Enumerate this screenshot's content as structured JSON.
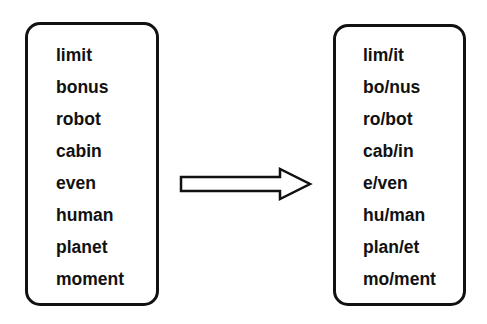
{
  "left_box": {
    "words": [
      "limit",
      "bonus",
      "robot",
      "cabin",
      "even",
      "human",
      "planet",
      "moment"
    ]
  },
  "arrow": {
    "icon": "right-arrow-icon",
    "direction": "right"
  },
  "right_box": {
    "words": [
      "lim/it",
      "bo/nus",
      "ro/bot",
      "cab/in",
      "e/ven",
      "hu/man",
      "plan/et",
      "mo/ment"
    ]
  },
  "colors": {
    "stroke": "#111111",
    "background": "#ffffff",
    "text": "#111111"
  }
}
